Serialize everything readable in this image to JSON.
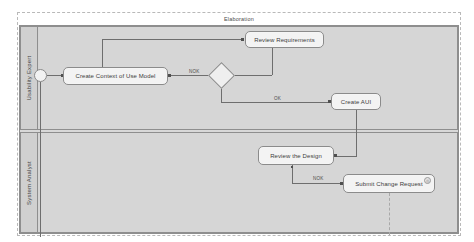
{
  "diagram": {
    "type": "uml-activity-diagram",
    "phase_title": "Elaboration",
    "colors": {
      "lane_fill": "#d6d6d6",
      "node_fill": "#f3f3f3",
      "node_border": "#8b8b8b",
      "edge": "#6e6e6e",
      "selection_border": "#b9b9b9"
    },
    "lanes": [
      {
        "id": "usability-expert",
        "label": "Usability Expert"
      },
      {
        "id": "system-analyst",
        "label": "System Analyst"
      }
    ],
    "nodes": {
      "initial": {
        "kind": "initial-node",
        "label": ""
      },
      "review_requirements": {
        "kind": "action",
        "label": "Review Requirements"
      },
      "create_context": {
        "kind": "action",
        "label": "Create Context of Use Model"
      },
      "decision": {
        "kind": "decision-node",
        "label": ""
      },
      "create_aui": {
        "kind": "action",
        "label": "Create AUI"
      },
      "review_design": {
        "kind": "action",
        "label": "Review the Design"
      },
      "submit_change": {
        "kind": "action",
        "label": "Submit Change Request",
        "badge": "◎"
      }
    },
    "guards": {
      "decision_nok": "NOK",
      "decision_ok": "OK",
      "design_nok": "NOK"
    }
  }
}
